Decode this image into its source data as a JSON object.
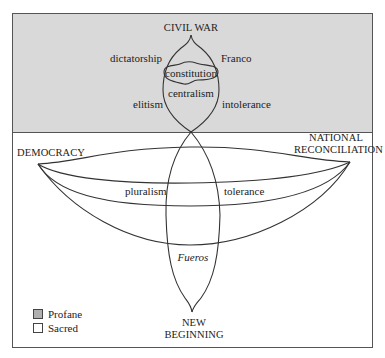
{
  "diagram": {
    "top_node": "CIVIL WAR",
    "bottom_node": [
      "NEW",
      "BEGINNING"
    ],
    "left_node": "DEMOCRACY",
    "right_node": [
      "NATIONAL",
      "RECONCILIATION"
    ],
    "profane_labels": {
      "upper_left": "dictatorship",
      "upper_right": "Franco",
      "core": "constitution",
      "inner": "centralism",
      "lower_left": "elitism",
      "lower_right": "intolerance"
    },
    "sacred_labels": {
      "left": "pluralism",
      "right": "tolerance",
      "center": "Fueros"
    },
    "colors": {
      "profane": "#d9d9d9",
      "sacred": "#ffffff",
      "line": "#333333"
    }
  },
  "legend": {
    "items": [
      {
        "label": "Profane",
        "color": "#b0b0b0"
      },
      {
        "label": "Sacred",
        "color": "#ffffff"
      }
    ]
  }
}
